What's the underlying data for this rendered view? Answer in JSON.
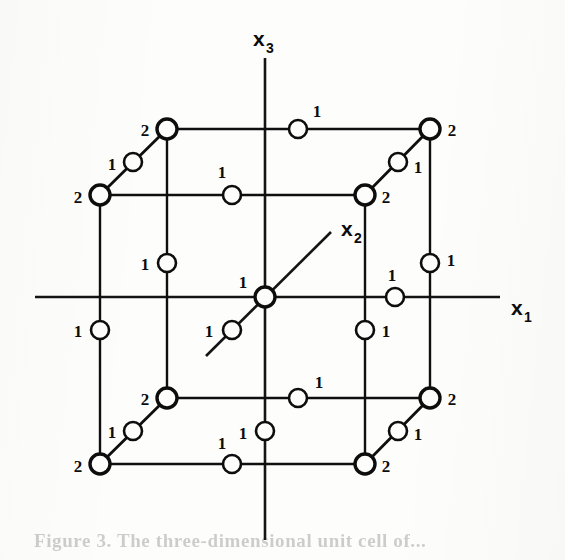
{
  "figure": {
    "kind": "geometry-diagram",
    "background_color": "#fdfdfc",
    "ink_color": "#0d0d0d",
    "caption_partial": "Figure 3.  The three-dimensional unit cell of..."
  },
  "axes": {
    "x1": {
      "label": "x",
      "subscript": "1",
      "label_x": 511,
      "label_y": 315,
      "line": {
        "x1": 35,
        "y1": 297,
        "x2": 500,
        "y2": 297
      },
      "orientation": "horizontal-right"
    },
    "x2": {
      "label": "x",
      "subscript": "2",
      "label_x": 341,
      "label_y": 236,
      "line": {
        "x1": 206,
        "y1": 356,
        "x2": 331,
        "y2": 232
      },
      "orientation": "diagonal-up-right"
    },
    "x3": {
      "label": "x",
      "subscript": "3",
      "label_x": 253,
      "label_y": 46,
      "line": {
        "x1": 265,
        "y1": 58,
        "x2": 265,
        "y2": 540
      },
      "orientation": "vertical-up"
    }
  },
  "cube": {
    "front_face": {
      "left": 100,
      "right": 365,
      "top": 195,
      "bottom": 464
    },
    "back_face": {
      "left": 167,
      "right": 430,
      "top": 129,
      "bottom": 398
    },
    "depth_offset": {
      "dx": 67,
      "dy": -66
    }
  },
  "markers": {
    "circle_radius_small": 9,
    "circle_radius_large": 10,
    "legend_note": "open circles mark lattice sites; numeral gives site multiplicity",
    "points": [
      {
        "id": "back-top-left",
        "cx": 167,
        "cy": 129,
        "value": "2",
        "lx": 145,
        "ly": 136,
        "size": "large"
      },
      {
        "id": "back-top-mid",
        "cx": 298,
        "cy": 129,
        "value": "1",
        "lx": 317,
        "ly": 117,
        "size": "small"
      },
      {
        "id": "back-top-right",
        "cx": 430,
        "cy": 129,
        "value": "2",
        "lx": 452,
        "ly": 136,
        "size": "large"
      },
      {
        "id": "back-left-diag-mid",
        "cx": 133,
        "cy": 162,
        "value": "1",
        "lx": 112,
        "ly": 170,
        "size": "small"
      },
      {
        "id": "back-right-diag-mid",
        "cx": 398,
        "cy": 162,
        "value": "1",
        "lx": 418,
        "ly": 173,
        "size": "small"
      },
      {
        "id": "front-top-left",
        "cx": 100,
        "cy": 195,
        "value": "2",
        "lx": 78,
        "ly": 203,
        "size": "large"
      },
      {
        "id": "front-top-mid",
        "cx": 232,
        "cy": 195,
        "value": "1",
        "lx": 222,
        "ly": 178,
        "size": "small"
      },
      {
        "id": "front-top-right",
        "cx": 365,
        "cy": 195,
        "value": "2",
        "lx": 386,
        "ly": 203,
        "size": "large"
      },
      {
        "id": "back-left-vert-mid",
        "cx": 167,
        "cy": 263,
        "value": "1",
        "lx": 145,
        "ly": 270,
        "size": "small"
      },
      {
        "id": "back-right-vert-mid",
        "cx": 430,
        "cy": 263,
        "value": "1",
        "lx": 451,
        "ly": 266,
        "size": "small"
      },
      {
        "id": "body-center-origin",
        "cx": 265,
        "cy": 297,
        "value": "1",
        "lx": 243,
        "ly": 288,
        "size": "large"
      },
      {
        "id": "right-face-center",
        "cx": 395,
        "cy": 297,
        "value": "1",
        "lx": 392,
        "ly": 281,
        "size": "small"
      },
      {
        "id": "front-left-vert-mid",
        "cx": 100,
        "cy": 330,
        "value": "1",
        "lx": 78,
        "ly": 337,
        "size": "small"
      },
      {
        "id": "front-diag-lower-mid",
        "cx": 232,
        "cy": 330,
        "value": "1",
        "lx": 209,
        "ly": 337,
        "size": "small"
      },
      {
        "id": "front-right-vert-mid",
        "cx": 365,
        "cy": 330,
        "value": "1",
        "lx": 386,
        "ly": 337,
        "size": "small"
      },
      {
        "id": "bot-back-left",
        "cx": 167,
        "cy": 398,
        "value": "2",
        "lx": 145,
        "ly": 405,
        "size": "large"
      },
      {
        "id": "bot-back-mid",
        "cx": 298,
        "cy": 398,
        "value": "1",
        "lx": 319,
        "ly": 388,
        "size": "small"
      },
      {
        "id": "bot-back-right",
        "cx": 430,
        "cy": 398,
        "value": "2",
        "lx": 452,
        "ly": 405,
        "size": "large"
      },
      {
        "id": "bot-left-diag-mid",
        "cx": 133,
        "cy": 431,
        "value": "1",
        "lx": 112,
        "ly": 438,
        "size": "small"
      },
      {
        "id": "bot-face-center",
        "cx": 265,
        "cy": 431,
        "value": "1",
        "lx": 243,
        "ly": 439,
        "size": "small"
      },
      {
        "id": "bot-right-diag-mid",
        "cx": 398,
        "cy": 431,
        "value": "1",
        "lx": 418,
        "ly": 440,
        "size": "small"
      },
      {
        "id": "bot-front-left",
        "cx": 100,
        "cy": 464,
        "value": "2",
        "lx": 78,
        "ly": 472,
        "size": "large"
      },
      {
        "id": "bot-front-mid",
        "cx": 232,
        "cy": 464,
        "value": "1",
        "lx": 222,
        "ly": 449,
        "size": "small"
      },
      {
        "id": "bot-front-right",
        "cx": 365,
        "cy": 464,
        "value": "2",
        "lx": 386,
        "ly": 472,
        "size": "large"
      }
    ]
  }
}
